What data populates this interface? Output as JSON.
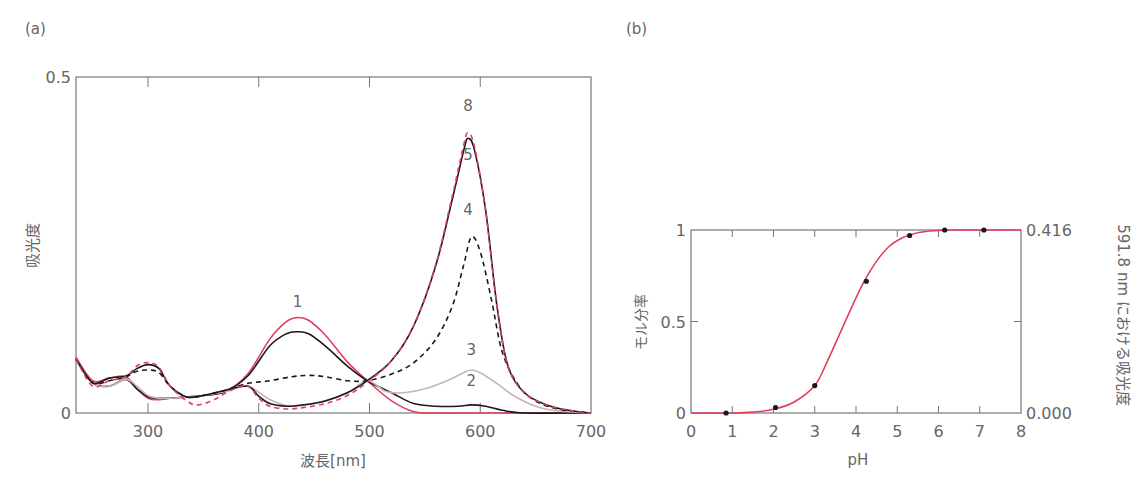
{
  "panels": {
    "a_label": "(a)",
    "b_label": "(b)"
  },
  "colors": {
    "pink": "#e0405e",
    "black": "#1a1a1a",
    "gray": "#c8b4b4",
    "axis": "#777777",
    "text": "#666666"
  },
  "chart_data": [
    {
      "id": "a",
      "type": "line",
      "title": "",
      "xlabel": "波長[nm]",
      "ylabel": "吸光度",
      "xlim": [
        235,
        700
      ],
      "ylim": [
        0,
        0.5
      ],
      "xticks": [
        300,
        400,
        500,
        600,
        700
      ],
      "yticks": [
        0,
        0.5
      ],
      "ytick_labels": [
        "0",
        "0.5"
      ],
      "grid": false,
      "curve_labels": [
        {
          "text": "1",
          "x": 435,
          "y": 0.158
        },
        {
          "text": "8",
          "x": 589,
          "y": 0.449
        },
        {
          "text": "5",
          "x": 589,
          "y": 0.376
        },
        {
          "text": "4",
          "x": 589,
          "y": 0.294
        },
        {
          "text": "3",
          "x": 592,
          "y": 0.086
        },
        {
          "text": "2",
          "x": 592,
          "y": 0.04
        }
      ],
      "series": [
        {
          "name": "1",
          "style": "pink-solid",
          "x": [
            235,
            250,
            265,
            280,
            290,
            300,
            310,
            320,
            335,
            350,
            370,
            390,
            410,
            425,
            435,
            445,
            460,
            480,
            498,
            520,
            540,
            560,
            600,
            650,
            700
          ],
          "y": [
            0.083,
            0.048,
            0.052,
            0.054,
            0.036,
            0.022,
            0.02,
            0.022,
            0.024,
            0.026,
            0.032,
            0.058,
            0.11,
            0.136,
            0.142,
            0.138,
            0.116,
            0.076,
            0.048,
            0.018,
            0.002,
            0.0,
            0.0,
            0.0,
            0.0
          ]
        },
        {
          "name": "2",
          "style": "black-solid",
          "x": [
            235,
            250,
            265,
            280,
            290,
            300,
            310,
            320,
            335,
            350,
            370,
            390,
            410,
            425,
            435,
            445,
            460,
            480,
            498,
            520,
            540,
            560,
            580,
            592,
            605,
            620,
            640,
            700
          ],
          "y": [
            0.08,
            0.045,
            0.04,
            0.05,
            0.036,
            0.024,
            0.022,
            0.022,
            0.024,
            0.026,
            0.032,
            0.055,
            0.1,
            0.118,
            0.121,
            0.118,
            0.1,
            0.07,
            0.048,
            0.03,
            0.014,
            0.01,
            0.01,
            0.012,
            0.01,
            0.004,
            0.0,
            0.0
          ]
        },
        {
          "name": "3",
          "style": "gray-solid",
          "x": [
            235,
            250,
            265,
            280,
            290,
            300,
            310,
            320,
            335,
            350,
            370,
            390,
            410,
            430,
            460,
            480,
            498,
            515,
            530,
            550,
            570,
            585,
            592,
            600,
            615,
            630,
            650,
            670,
            700
          ],
          "y": [
            0.08,
            0.045,
            0.04,
            0.05,
            0.04,
            0.026,
            0.022,
            0.022,
            0.024,
            0.026,
            0.032,
            0.04,
            0.02,
            0.01,
            0.018,
            0.03,
            0.048,
            0.032,
            0.03,
            0.036,
            0.048,
            0.06,
            0.064,
            0.06,
            0.044,
            0.026,
            0.01,
            0.003,
            0.0
          ]
        },
        {
          "name": "4",
          "style": "black-dashed",
          "x": [
            235,
            250,
            265,
            280,
            290,
            300,
            310,
            320,
            335,
            350,
            370,
            390,
            410,
            430,
            445,
            460,
            480,
            498,
            520,
            540,
            560,
            575,
            585,
            592,
            600,
            610,
            620,
            635,
            650,
            670,
            700
          ],
          "y": [
            0.08,
            0.045,
            0.048,
            0.054,
            0.062,
            0.064,
            0.06,
            0.04,
            0.024,
            0.026,
            0.034,
            0.044,
            0.048,
            0.054,
            0.056,
            0.054,
            0.048,
            0.048,
            0.058,
            0.075,
            0.11,
            0.16,
            0.22,
            0.262,
            0.24,
            0.17,
            0.09,
            0.04,
            0.018,
            0.006,
            0.0
          ]
        },
        {
          "name": "5",
          "style": "black-solid",
          "x": [
            235,
            250,
            265,
            280,
            290,
            300,
            310,
            320,
            335,
            350,
            370,
            390,
            400,
            410,
            425,
            440,
            460,
            480,
            498,
            520,
            540,
            560,
            575,
            585,
            589,
            595,
            605,
            615,
            625,
            640,
            660,
            680,
            700
          ],
          "y": [
            0.08,
            0.045,
            0.052,
            0.055,
            0.066,
            0.072,
            0.066,
            0.04,
            0.024,
            0.026,
            0.034,
            0.04,
            0.025,
            0.014,
            0.01,
            0.012,
            0.018,
            0.03,
            0.048,
            0.078,
            0.13,
            0.22,
            0.32,
            0.39,
            0.409,
            0.39,
            0.3,
            0.16,
            0.07,
            0.03,
            0.012,
            0.004,
            0.0
          ]
        },
        {
          "name": "8",
          "style": "pink-dashed",
          "x": [
            235,
            250,
            265,
            280,
            290,
            300,
            310,
            320,
            335,
            345,
            360,
            375,
            390,
            400,
            410,
            425,
            440,
            460,
            480,
            498,
            520,
            540,
            560,
            575,
            585,
            589,
            595,
            605,
            615,
            625,
            640,
            660,
            680,
            700
          ],
          "y": [
            0.08,
            0.04,
            0.048,
            0.054,
            0.07,
            0.075,
            0.068,
            0.04,
            0.018,
            0.012,
            0.02,
            0.034,
            0.04,
            0.022,
            0.01,
            0.006,
            0.008,
            0.014,
            0.026,
            0.046,
            0.078,
            0.13,
            0.222,
            0.325,
            0.398,
            0.417,
            0.395,
            0.3,
            0.16,
            0.07,
            0.03,
            0.012,
            0.004,
            0.0
          ]
        }
      ]
    },
    {
      "id": "b",
      "type": "scatter",
      "title": "",
      "xlabel": "pH",
      "ylabel": "モル分率",
      "ylabel_right": "591.8 nm における吸光度",
      "xlim": [
        0,
        8
      ],
      "ylim": [
        0,
        1
      ],
      "xticks": [
        0,
        1,
        2,
        3,
        4,
        5,
        6,
        7,
        8
      ],
      "yticks": [
        0,
        0.5,
        1
      ],
      "ytick_labels": [
        "0",
        "0.5",
        "1"
      ],
      "yticks_right": [
        0,
        1
      ],
      "ytick_labels_right": [
        "0.000",
        "0.416"
      ],
      "grid": false,
      "points": {
        "x": [
          0.85,
          2.05,
          3.0,
          4.25,
          5.3,
          6.15,
          7.1
        ],
        "y": [
          0.0,
          0.03,
          0.15,
          0.72,
          0.97,
          1.0,
          1.0
        ]
      },
      "fit_curve": {
        "style": "pink-solid",
        "x": [
          0,
          1.0,
          1.5,
          2.0,
          2.5,
          3.0,
          3.3,
          3.6,
          3.9,
          4.2,
          4.5,
          4.8,
          5.1,
          5.4,
          5.7,
          6.0,
          6.3,
          6.6,
          7.0,
          8.0
        ],
        "y": [
          0,
          0.0,
          0.005,
          0.02,
          0.06,
          0.15,
          0.28,
          0.43,
          0.58,
          0.72,
          0.83,
          0.91,
          0.955,
          0.98,
          0.992,
          0.997,
          1.0,
          1.0,
          1.0,
          1.0
        ]
      }
    }
  ]
}
